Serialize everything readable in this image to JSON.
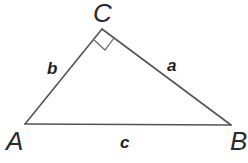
{
  "diagram": {
    "type": "right-triangle",
    "vertices": [
      {
        "id": "A",
        "label": "A",
        "x": 25,
        "y": 124
      },
      {
        "id": "B",
        "label": "B",
        "x": 231,
        "y": 125
      },
      {
        "id": "C",
        "label": "C",
        "x": 102,
        "y": 29
      }
    ],
    "sides": [
      {
        "id": "a",
        "label": "a",
        "between": [
          "B",
          "C"
        ]
      },
      {
        "id": "b",
        "label": "b",
        "between": [
          "A",
          "C"
        ]
      },
      {
        "id": "c",
        "label": "c",
        "between": [
          "A",
          "B"
        ]
      }
    ],
    "right_angle_at": "C",
    "colors": {
      "line": "#555555",
      "text": "#2a2a2a",
      "background": "#ffffff"
    }
  }
}
